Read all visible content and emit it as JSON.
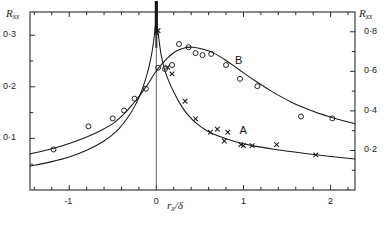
{
  "chart_data": {
    "type": "scatter",
    "title": "",
    "xlabel": "r_x/δ",
    "ylabel_left": "R_xx",
    "ylabel_right": "R_xx",
    "xlim": [
      -1.45,
      2.28
    ],
    "ylim_left": [
      0.0,
      0.345
    ],
    "ylim_right": [
      0.0,
      0.9
    ],
    "grid": false,
    "legend_position": "inline-annotations",
    "x_ticks_major": [
      -1,
      0,
      1,
      2
    ],
    "x_tick_labels": [
      "-1",
      "0",
      "1",
      "2"
    ],
    "x_ticks_minor": [
      -1.4,
      -1.2,
      -0.8,
      -0.6,
      -0.4,
      -0.2,
      0.2,
      0.4,
      0.6,
      0.8,
      1.2,
      1.4,
      1.6,
      1.8,
      2.2
    ],
    "y_ticks_left": [
      0.1,
      0.2,
      0.3
    ],
    "y_tick_labels_left": [
      "0·1",
      "0·2",
      "0·3"
    ],
    "y_ticks_left_minor": [
      0.05,
      0.15,
      0.25
    ],
    "y_ticks_right": [
      0.2,
      0.4,
      0.6,
      0.8
    ],
    "y_tick_labels_right": [
      "0·2",
      "0·4",
      "0·6",
      "0·8"
    ],
    "y_ticks_right_minor": [
      0.1,
      0.3,
      0.5,
      0.7
    ],
    "annotations": [
      {
        "text": "A",
        "x": 1.0,
        "y": 0.112
      },
      {
        "text": "B",
        "x": 0.95,
        "y": 0.248
      }
    ],
    "series": [
      {
        "name": "A",
        "marker": "x",
        "axis": "left",
        "points": [
          {
            "x": 0.02,
            "y": 0.309
          },
          {
            "x": 0.13,
            "y": 0.238
          },
          {
            "x": 0.18,
            "y": 0.225
          },
          {
            "x": 0.33,
            "y": 0.172
          },
          {
            "x": 0.45,
            "y": 0.138
          },
          {
            "x": 0.62,
            "y": 0.112
          },
          {
            "x": 0.7,
            "y": 0.118
          },
          {
            "x": 0.82,
            "y": 0.112
          },
          {
            "x": 0.78,
            "y": 0.095
          },
          {
            "x": 0.97,
            "y": 0.088
          },
          {
            "x": 1.0,
            "y": 0.086
          },
          {
            "x": 1.1,
            "y": 0.086
          },
          {
            "x": 1.38,
            "y": 0.088
          },
          {
            "x": 1.83,
            "y": 0.068
          }
        ]
      },
      {
        "name": "B",
        "marker": "o",
        "axis": "right",
        "points": [
          {
            "x": -1.18,
            "y": 0.205
          },
          {
            "x": -0.78,
            "y": 0.322
          },
          {
            "x": -0.5,
            "y": 0.362
          },
          {
            "x": -0.37,
            "y": 0.402
          },
          {
            "x": -0.25,
            "y": 0.462
          },
          {
            "x": -0.12,
            "y": 0.512
          },
          {
            "x": 0.02,
            "y": 0.618
          },
          {
            "x": 0.1,
            "y": 0.612
          },
          {
            "x": 0.18,
            "y": 0.632
          },
          {
            "x": 0.26,
            "y": 0.738
          },
          {
            "x": 0.37,
            "y": 0.722
          },
          {
            "x": 0.45,
            "y": 0.692
          },
          {
            "x": 0.53,
            "y": 0.682
          },
          {
            "x": 0.63,
            "y": 0.688
          },
          {
            "x": 0.8,
            "y": 0.632
          },
          {
            "x": 0.96,
            "y": 0.562
          },
          {
            "x": 1.16,
            "y": 0.525
          },
          {
            "x": 1.66,
            "y": 0.372
          },
          {
            "x": 2.02,
            "y": 0.362
          }
        ]
      }
    ],
    "curves": [
      {
        "name": "curve-A",
        "description": "sharply peaked curve, divergent at x=0, left axis"
      },
      {
        "name": "curve-B",
        "description": "broad asymmetric peak centred near x=0.4, right axis"
      }
    ]
  },
  "labels": {
    "y_left_title_main": "R",
    "y_left_title_sub": "xx",
    "y_right_title_main": "R",
    "y_right_title_sub": "xx",
    "x_title_main": "r",
    "x_title_sub": "x",
    "x_title_tail": "/δ",
    "curve_a": "A",
    "curve_b": "B"
  },
  "colors": {
    "axis": "#2b2b2b",
    "curve": "#1a1a1a",
    "marker": "#1a1a1a",
    "background": "#ffffff"
  }
}
